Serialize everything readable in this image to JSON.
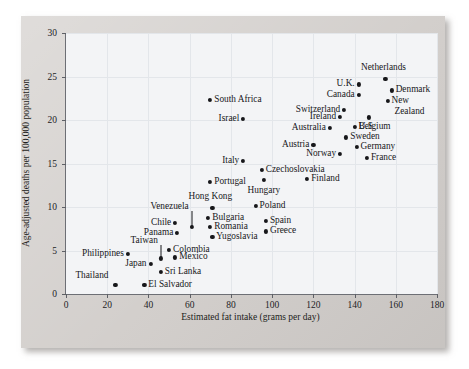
{
  "chart_data": {
    "type": "scatter",
    "title": "",
    "xlabel": "Estimated fat intake (grams per day)",
    "ylabel": "Age-adjusted deaths per 100,000 population",
    "xlim": [
      0,
      180
    ],
    "ylim": [
      0,
      30
    ],
    "xticks": [
      0,
      20,
      40,
      60,
      80,
      100,
      120,
      140,
      160,
      180
    ],
    "yticks": [
      0,
      5,
      10,
      15,
      20,
      25,
      30
    ],
    "grid": true,
    "legend": "none",
    "points": [
      {
        "label": "Thailand",
        "x": 24,
        "y": 1.0,
        "anchor": "end",
        "dx": -7,
        "dy": -9
      },
      {
        "label": "El Salvador",
        "x": 38,
        "y": 1.0,
        "anchor": "start",
        "dx": 4,
        "dy": 0
      },
      {
        "label": "Sri Lanka",
        "x": 46,
        "y": 2.5,
        "anchor": "start",
        "dx": 4,
        "dy": 0
      },
      {
        "label": "Japan",
        "x": 41,
        "y": 3.5,
        "anchor": "end",
        "dx": -4,
        "dy": 0
      },
      {
        "label": "Mexico",
        "x": 53,
        "y": 4.2,
        "anchor": "start",
        "dx": 4,
        "dy": 0
      },
      {
        "label": "Philippines",
        "x": 30,
        "y": 4.6,
        "anchor": "end",
        "dx": -4,
        "dy": 0
      },
      {
        "label": "Taiwan",
        "x": 46,
        "y": 4.1,
        "anchor": "end",
        "dx": -3,
        "dy": -17,
        "leader": true
      },
      {
        "label": "Colombia",
        "x": 50,
        "y": 5.1,
        "anchor": "start",
        "dx": 4,
        "dy": 0
      },
      {
        "label": "Yugoslavia",
        "x": 71,
        "y": 6.6,
        "anchor": "start",
        "dx": 4,
        "dy": 0
      },
      {
        "label": "Panama",
        "x": 54,
        "y": 7.0,
        "anchor": "end",
        "dx": -4,
        "dy": 0
      },
      {
        "label": "Greece",
        "x": 97,
        "y": 7.2,
        "anchor": "start",
        "dx": 4,
        "dy": 0
      },
      {
        "label": "Romania",
        "x": 70,
        "y": 7.7,
        "anchor": "start",
        "dx": 4,
        "dy": 0
      },
      {
        "label": "Venezuela",
        "x": 61,
        "y": 7.7,
        "anchor": "end",
        "dx": -3,
        "dy": -20,
        "leader": true
      },
      {
        "label": "Chile",
        "x": 53,
        "y": 8.2,
        "anchor": "end",
        "dx": -4,
        "dy": 0
      },
      {
        "label": "Spain",
        "x": 97,
        "y": 8.4,
        "anchor": "start",
        "dx": 4,
        "dy": 0
      },
      {
        "label": "Bulgaria",
        "x": 69,
        "y": 8.7,
        "anchor": "start",
        "dx": 4,
        "dy": 0
      },
      {
        "label": "Hong Kong",
        "x": 71,
        "y": 9.9,
        "anchor": "mid",
        "dx": -2,
        "dy": -11
      },
      {
        "label": "Poland",
        "x": 92,
        "y": 10.1,
        "anchor": "start",
        "dx": 4,
        "dy": 0
      },
      {
        "label": "Hungary",
        "x": 96,
        "y": 13.1,
        "anchor": "mid",
        "dx": 0,
        "dy": 11
      },
      {
        "label": "Portugal",
        "x": 70,
        "y": 12.9,
        "anchor": "start",
        "dx": 4,
        "dy": 0
      },
      {
        "label": "Finland",
        "x": 117,
        "y": 13.2,
        "anchor": "start",
        "dx": 4,
        "dy": 0
      },
      {
        "label": "Czechoslovakia",
        "x": 95,
        "y": 14.3,
        "anchor": "start",
        "dx": 4,
        "dy": 0
      },
      {
        "label": "Italy",
        "x": 86,
        "y": 15.3,
        "anchor": "end",
        "dx": -4,
        "dy": 0
      },
      {
        "label": "France",
        "x": 146,
        "y": 15.6,
        "anchor": "start",
        "dx": 4,
        "dy": 0
      },
      {
        "label": "Norway",
        "x": 133,
        "y": 16.1,
        "anchor": "end",
        "dx": -4,
        "dy": 0
      },
      {
        "label": "Germany",
        "x": 141,
        "y": 16.9,
        "anchor": "start",
        "dx": 4,
        "dy": 0
      },
      {
        "label": "Austria",
        "x": 120,
        "y": 17.1,
        "anchor": "end",
        "dx": -4,
        "dy": 0
      },
      {
        "label": "Sweden",
        "x": 136,
        "y": 18.0,
        "anchor": "start",
        "dx": 4,
        "dy": 0
      },
      {
        "label": "Australia",
        "x": 128,
        "y": 19.1,
        "anchor": "end",
        "dx": -4,
        "dy": 0
      },
      {
        "label": "Belgium",
        "x": 140,
        "y": 19.2,
        "anchor": "start",
        "dx": 4,
        "dy": 0
      },
      {
        "label": "Israel",
        "x": 86,
        "y": 20.1,
        "anchor": "end",
        "dx": -4,
        "dy": 0
      },
      {
        "label": "Ireland",
        "x": 133,
        "y": 20.4,
        "anchor": "end",
        "dx": -4,
        "dy": 0
      },
      {
        "label": "U.S.",
        "x": 147,
        "y": 20.3,
        "anchor": "mid",
        "dx": -2,
        "dy": 10
      },
      {
        "label": "Switzerland",
        "x": 135,
        "y": 21.2,
        "anchor": "end",
        "dx": -4,
        "dy": 0
      },
      {
        "label": "New",
        "x": 156,
        "y": 22.2,
        "anchor": "start",
        "dx": 4,
        "dy": 0
      },
      {
        "label": "Zealand",
        "x": 156,
        "y": 22.2,
        "anchor": "start",
        "dx": 7,
        "dy": 11,
        "nodot": true
      },
      {
        "label": "South Africa",
        "x": 70,
        "y": 22.3,
        "anchor": "start",
        "dx": 4,
        "dy": 0
      },
      {
        "label": "Canada",
        "x": 142,
        "y": 22.9,
        "anchor": "end",
        "dx": -4,
        "dy": 0
      },
      {
        "label": "Denmark",
        "x": 158,
        "y": 23.4,
        "anchor": "start",
        "dx": 4,
        "dy": 0
      },
      {
        "label": "U.K.",
        "x": 142,
        "y": 24.1,
        "anchor": "end",
        "dx": -4,
        "dy": 0
      },
      {
        "label": "Netherlands",
        "x": 155,
        "y": 24.7,
        "anchor": "mid",
        "dx": -2,
        "dy": -11
      }
    ]
  }
}
